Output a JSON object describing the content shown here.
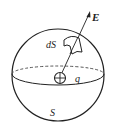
{
  "diagram": {
    "title": "",
    "type": "Gaussian surface with point charge",
    "labels": {
      "field": "E",
      "surface_element": "dS",
      "charge": "q",
      "surface": "S"
    },
    "elements": [
      {
        "id": "sphere",
        "kind": "circle",
        "label": "S"
      },
      {
        "id": "equator",
        "kind": "ellipse",
        "front": "solid",
        "back": "dashed"
      },
      {
        "id": "charge",
        "kind": "positive-charge",
        "label": "q"
      },
      {
        "id": "field-vector",
        "kind": "arrow",
        "label": "E",
        "from": "charge",
        "direction": "radially outward"
      },
      {
        "id": "surface-element",
        "kind": "curved-patch",
        "label": "dS"
      }
    ],
    "colors": {
      "stroke": "#222222",
      "background": "#ffffff"
    }
  }
}
